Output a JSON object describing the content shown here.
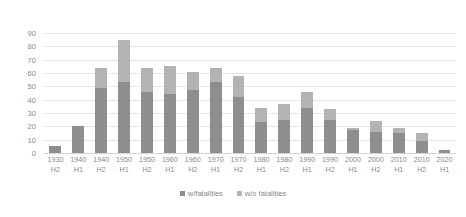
{
  "chart_data": {
    "type": "bar",
    "subtype": "stacked-bar",
    "title": "",
    "xlabel": "",
    "ylabel": "",
    "ylim": [
      0,
      90
    ],
    "yticks": [
      0,
      10,
      20,
      30,
      40,
      50,
      60,
      70,
      80,
      90
    ],
    "grid": true,
    "legend_position": "bottom",
    "categories": [
      "1930 H2",
      "1940 H1",
      "1940 H2",
      "1950 H1",
      "1950 H2",
      "1960 H1",
      "1960 H2",
      "1970 H1",
      "1970 H2",
      "1980 H1",
      "1980 H2",
      "1990 H1",
      "1990 H2",
      "2000 H1",
      "2000 H2",
      "2010 H1",
      "2010 H2",
      "2020 H1"
    ],
    "category_lines": [
      {
        "decade": "1930",
        "half": "H2"
      },
      {
        "decade": "1940",
        "half": "H1"
      },
      {
        "decade": "1940",
        "half": "H2"
      },
      {
        "decade": "1950",
        "half": "H1"
      },
      {
        "decade": "1950",
        "half": "H2"
      },
      {
        "decade": "1960",
        "half": "H1"
      },
      {
        "decade": "1960",
        "half": "H2"
      },
      {
        "decade": "1970",
        "half": "H1"
      },
      {
        "decade": "1970",
        "half": "H2"
      },
      {
        "decade": "1980",
        "half": "H1"
      },
      {
        "decade": "1980",
        "half": "H2"
      },
      {
        "decade": "1990",
        "half": "H1"
      },
      {
        "decade": "1990",
        "half": "H2"
      },
      {
        "decade": "2000",
        "half": "H1"
      },
      {
        "decade": "2000",
        "half": "H2"
      },
      {
        "decade": "2010",
        "half": "H1"
      },
      {
        "decade": "2010",
        "half": "H2"
      },
      {
        "decade": "2020",
        "half": "H1"
      }
    ],
    "series": [
      {
        "name": "w/fatalities",
        "color": "#8e8e8e",
        "values": [
          5,
          20,
          49,
          53,
          46,
          44,
          47,
          53,
          42,
          23,
          25,
          34,
          25,
          17,
          16,
          15,
          9,
          2
        ]
      },
      {
        "name": "w/o fatalities",
        "color": "#b3b3b3",
        "values": [
          0,
          0,
          15,
          32,
          18,
          21,
          14,
          11,
          16,
          11,
          12,
          12,
          8,
          2,
          8,
          4,
          6,
          0
        ]
      }
    ],
    "totals": [
      5,
      20,
      64,
      85,
      64,
      65,
      61,
      64,
      58,
      34,
      37,
      46,
      33,
      19,
      24,
      19,
      15,
      2
    ]
  },
  "legend": {
    "items": [
      {
        "label": "w/fatalities",
        "color": "#8e8e8e"
      },
      {
        "label": "w/o fatalities",
        "color": "#b3b3b3"
      }
    ]
  },
  "axis": {
    "y_tick_labels": [
      "90",
      "80",
      "70",
      "60",
      "50",
      "40",
      "30",
      "20",
      "10",
      "0"
    ]
  }
}
